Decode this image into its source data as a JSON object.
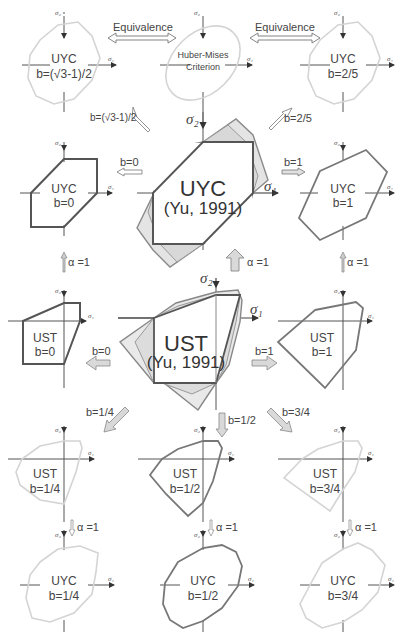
{
  "figure": {
    "colors": {
      "dark_line": "#555555",
      "mid_line": "#7a7a7a",
      "light_line": "#d4d4d4",
      "arrow_fill": "#d9d9d9",
      "arrow_stroke": "#8a8a8a"
    }
  },
  "axes": {
    "x_symbol": "σ₁",
    "y_symbol": "σ₂"
  },
  "row1": {
    "left": {
      "name": "UYC",
      "param": "b=(√3-1)/2"
    },
    "center": {
      "name_line1": "Huber-Mises",
      "name_line2": "Criterion"
    },
    "right": {
      "name": "UYC",
      "param": "b=2/5"
    },
    "equiv_left": "Equivalence",
    "equiv_right": "Equivalence"
  },
  "row1_arrows": {
    "left": "b=(√3-1)/2",
    "right": "b=2/5"
  },
  "row2": {
    "left": {
      "name": "UYC",
      "param": "b=0"
    },
    "center": {
      "name": "UYC",
      "ref": "(Yu, 1991)"
    },
    "right": {
      "name": "UYC",
      "param": "b=1"
    },
    "arrow_left": "b=0",
    "arrow_right": "b=1"
  },
  "alpha_arrows": {
    "label": "α =1"
  },
  "row3": {
    "left": {
      "name": "UST",
      "param": "b=0"
    },
    "center": {
      "name": "UST",
      "ref": "(Yu, 1991)"
    },
    "right": {
      "name": "UST",
      "param": "b=1"
    },
    "arrow_left": "b=0",
    "arrow_right": "b=1"
  },
  "row3_arrows": {
    "left": "b=1/4",
    "center": "b=1/2",
    "right": "b=3/4"
  },
  "row4": {
    "left": {
      "name": "UST",
      "param": "b=1/4"
    },
    "center": {
      "name": "UST",
      "param": "b=1/2"
    },
    "right": {
      "name": "UST",
      "param": "b=3/4"
    }
  },
  "row5": {
    "left": {
      "name": "UYC",
      "param": "b=1/4"
    },
    "center": {
      "name": "UYC",
      "param": "b=1/2"
    },
    "right": {
      "name": "UYC",
      "param": "b=3/4"
    }
  }
}
